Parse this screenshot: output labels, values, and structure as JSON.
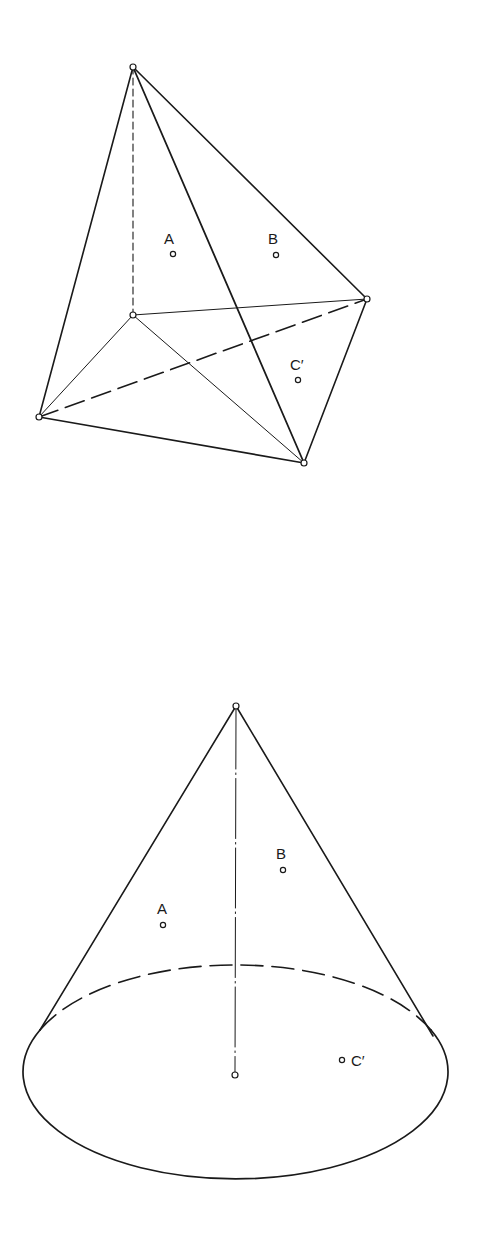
{
  "figures": [
    {
      "name": "tetrahedron-pyramid",
      "labels": {
        "a": "A",
        "b": "B",
        "c": "C′"
      }
    },
    {
      "name": "cone",
      "labels": {
        "a": "A",
        "b": "B",
        "c": "C′"
      }
    }
  ],
  "colors": {
    "stroke": "#1a1a1a",
    "background": "#ffffff"
  }
}
